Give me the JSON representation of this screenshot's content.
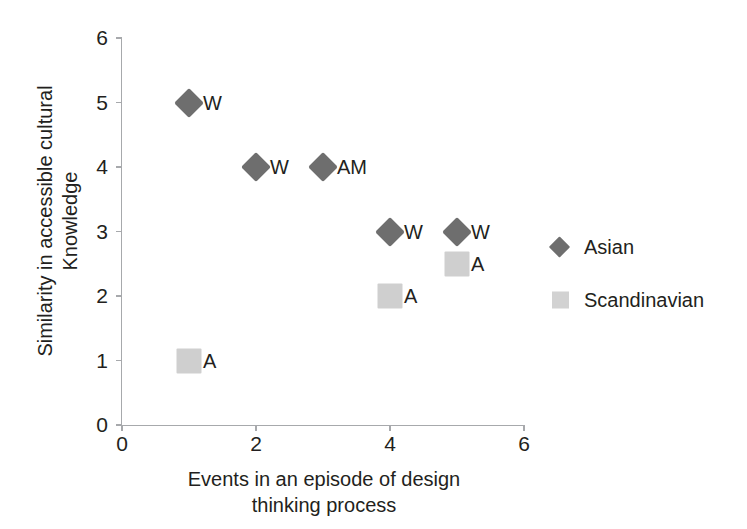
{
  "chart_data": {
    "type": "scatter",
    "title": "",
    "xlabel": "Events in an episode of design thinking process",
    "xlabel_lines": [
      "Events in an episode of design",
      "thinking process"
    ],
    "ylabel": "Similarity in accessible cultural Knowledge",
    "ylabel_lines": [
      "Similarity in accessible cultural",
      "Knowledge"
    ],
    "xlim": [
      0,
      6
    ],
    "ylim": [
      0,
      6
    ],
    "x_ticks": [
      0,
      2,
      4,
      6
    ],
    "x_tick_labels": [
      "0",
      "2",
      "4",
      "6"
    ],
    "y_ticks": [
      0,
      1,
      2,
      3,
      4,
      5,
      6
    ],
    "y_tick_labels": [
      "0",
      "1",
      "2",
      "3",
      "4",
      "5",
      "6"
    ],
    "grid": false,
    "legend_position": "right",
    "series": [
      {
        "name": "Asian",
        "marker": "diamond",
        "color": "#6e6e6e",
        "points": [
          {
            "x": 1,
            "y": 5,
            "label": "W"
          },
          {
            "x": 2,
            "y": 4,
            "label": "W"
          },
          {
            "x": 3,
            "y": 4,
            "label": "AM"
          },
          {
            "x": 4,
            "y": 3,
            "label": "W"
          },
          {
            "x": 5,
            "y": 3,
            "label": "W"
          }
        ]
      },
      {
        "name": "Scandinavian",
        "marker": "square",
        "color": "#cfcfcf",
        "points": [
          {
            "x": 1,
            "y": 1,
            "label": "A"
          },
          {
            "x": 4,
            "y": 2,
            "label": "A"
          },
          {
            "x": 5,
            "y": 2.5,
            "label": "A"
          }
        ]
      }
    ]
  },
  "legend": {
    "items": [
      {
        "label": "Asian",
        "marker": "diamond",
        "color": "#6e6e6e"
      },
      {
        "label": "Scandinavian",
        "marker": "square",
        "color": "#d2d2d2"
      }
    ]
  },
  "colors": {
    "background": "#ffffff",
    "axis": "#a7a9ac",
    "text": "#231f20",
    "asian_marker": "#6e6e6e",
    "scandinavian_marker": "#cfcfcf"
  }
}
